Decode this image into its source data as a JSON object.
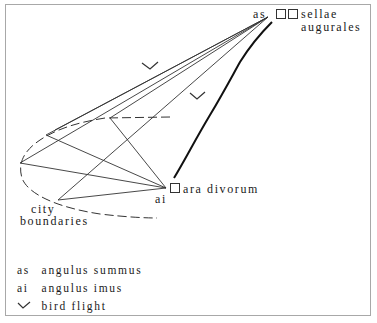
{
  "diagram": {
    "labels": {
      "as_point": "as",
      "sellae_line1": "sellae",
      "sellae_line2": "augurales",
      "ai_point": "ai",
      "ara": "ara divorum",
      "city_line1": "city",
      "city_line2": "boundaries"
    },
    "points": {
      "as": [
        268,
        17
      ],
      "ai": [
        166,
        188
      ],
      "left": [
        20,
        163
      ],
      "upper_left": [
        46,
        135
      ],
      "upper_mid": [
        110,
        118
      ],
      "lower": [
        58,
        200
      ]
    }
  },
  "legend": {
    "items": [
      {
        "symbol": "as",
        "label": "angulus summus"
      },
      {
        "symbol": "ai",
        "label": "angulus imus"
      },
      {
        "symbol": "checkmark-icon",
        "label": "bird flight"
      }
    ]
  },
  "colors": {
    "line": "#2a2a2a",
    "frame": "#a8a8a8"
  }
}
